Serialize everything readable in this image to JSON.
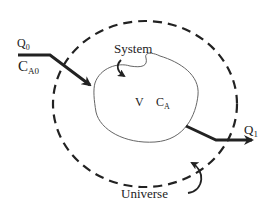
{
  "diagram": {
    "labels": {
      "inlet_flow": "Q",
      "inlet_flow_sub": "0",
      "inlet_conc": "C",
      "inlet_conc_sub": "A0",
      "system": "System",
      "volume": "V",
      "conc": "C",
      "conc_sub": "A",
      "outlet_flow": "Q",
      "outlet_flow_sub": "1",
      "universe": "Universe"
    },
    "colors": {
      "stroke": "#222222",
      "system_outline": "#666666",
      "background": "#ffffff"
    }
  }
}
